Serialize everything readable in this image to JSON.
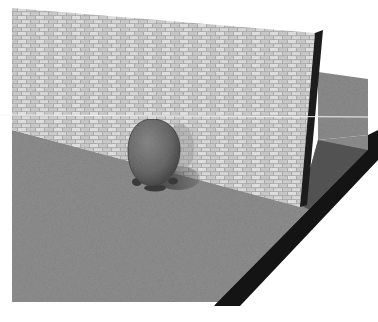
{
  "scene": {
    "description": "3D render of a textured stone/brick wall standing on a grey ground slab, with a grey egg-shaped character in front of the wall casting a shadow",
    "objects": [
      {
        "name": "brick-wall",
        "material": "light grey stone brick texture"
      },
      {
        "name": "ground-plane",
        "material": "grey speckled concrete"
      },
      {
        "name": "character",
        "shape": "egg / ovoid with small feet"
      },
      {
        "name": "horizon-line",
        "style": "thin white horizontal line"
      }
    ]
  },
  "colors": {
    "background": "#ffffff",
    "wall_light": "#d6d6d6",
    "wall_mortar": "#a9a9a9",
    "wall_edge": "#1e1e1e",
    "floor": "#8d8d8d",
    "floor_back": "#8a8a8a",
    "slab_edge": "#151515",
    "shadow": "#4a4a4a",
    "character": "#6f6f6f",
    "character_dark": "#3c3c3c",
    "line": "#f4f4f4"
  }
}
